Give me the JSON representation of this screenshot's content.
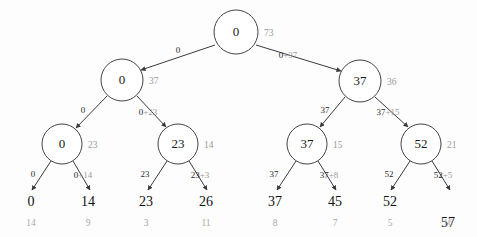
{
  "diagram": {
    "type": "binary-search-tree",
    "title": "",
    "nodes": [
      {
        "id": "n0",
        "value": "0",
        "size": "73",
        "cx": 236,
        "cy": 32,
        "r": 22,
        "level": 0
      },
      {
        "id": "n1",
        "value": "0",
        "size": "37",
        "cx": 122,
        "cy": 80,
        "r": 21,
        "level": 1
      },
      {
        "id": "n2",
        "value": "37",
        "size": "36",
        "cx": 360,
        "cy": 81,
        "r": 21,
        "level": 1
      },
      {
        "id": "n3",
        "value": "0",
        "size": "23",
        "cx": 62,
        "cy": 144,
        "r": 20,
        "level": 2
      },
      {
        "id": "n4",
        "value": "23",
        "size": "14",
        "cx": 178,
        "cy": 144,
        "r": 20,
        "level": 2
      },
      {
        "id": "n5",
        "value": "37",
        "size": "15",
        "cx": 307,
        "cy": 144,
        "r": 20,
        "level": 2
      },
      {
        "id": "n6",
        "value": "52",
        "size": "21",
        "cx": 421,
        "cy": 144,
        "r": 20,
        "level": 2
      }
    ],
    "edges": [
      {
        "id": "e0",
        "from": "n0",
        "to": "n1",
        "label_left": "0",
        "label_right": "",
        "x1": 215,
        "y1": 45,
        "x2": 141,
        "y2": 70,
        "lx": 178,
        "ly": 51
      },
      {
        "id": "e1",
        "from": "n0",
        "to": "n2",
        "label_left": "0",
        "label_right": "+37",
        "x1": 256,
        "y1": 45,
        "x2": 341,
        "y2": 71,
        "lx": 288,
        "ly": 56
      },
      {
        "id": "e2",
        "from": "n1",
        "to": "n3",
        "label_left": "0",
        "label_right": "",
        "x1": 107,
        "y1": 96,
        "x2": 76,
        "y2": 128,
        "lx": 83,
        "ly": 111
      },
      {
        "id": "e3",
        "from": "n1",
        "to": "n4",
        "label_left": "0",
        "label_right": "+23",
        "x1": 137,
        "y1": 96,
        "x2": 166,
        "y2": 127,
        "lx": 148,
        "ly": 113
      },
      {
        "id": "e4",
        "from": "n2",
        "to": "n5",
        "label_left": "37",
        "label_right": "",
        "x1": 345,
        "y1": 97,
        "x2": 320,
        "y2": 127,
        "lx": 325,
        "ly": 111
      },
      {
        "id": "e5",
        "from": "n2",
        "to": "n6",
        "label_left": "37",
        "label_right": "+15",
        "x1": 375,
        "y1": 97,
        "x2": 408,
        "y2": 127,
        "lx": 388,
        "ly": 113
      },
      {
        "id": "e6",
        "from": "n3",
        "to": "l0",
        "label_left": "0",
        "label_right": "",
        "x1": 51,
        "y1": 161,
        "x2": 32,
        "y2": 190,
        "lx": 33,
        "ly": 175
      },
      {
        "id": "e7",
        "from": "n3",
        "to": "l1",
        "label_left": "0",
        "label_right": "+14",
        "x1": 73,
        "y1": 161,
        "x2": 90,
        "y2": 190,
        "lx": 83,
        "ly": 176
      },
      {
        "id": "e8",
        "from": "n4",
        "to": "l2",
        "label_left": "23",
        "label_right": "",
        "x1": 167,
        "y1": 161,
        "x2": 148,
        "y2": 190,
        "lx": 145,
        "ly": 175
      },
      {
        "id": "e9",
        "from": "n4",
        "to": "l3",
        "label_left": "23",
        "label_right": "+3",
        "x1": 189,
        "y1": 161,
        "x2": 207,
        "y2": 190,
        "lx": 200,
        "ly": 176
      },
      {
        "id": "e10",
        "from": "n5",
        "to": "l4",
        "label_left": "37",
        "label_right": "",
        "x1": 296,
        "y1": 161,
        "x2": 277,
        "y2": 190,
        "lx": 274,
        "ly": 175
      },
      {
        "id": "e11",
        "from": "n5",
        "to": "l5",
        "label_left": "37",
        "label_right": "+8",
        "x1": 318,
        "y1": 161,
        "x2": 336,
        "y2": 190,
        "lx": 329,
        "ly": 176
      },
      {
        "id": "e12",
        "from": "n6",
        "to": "l6",
        "label_left": "52",
        "label_right": "",
        "x1": 410,
        "y1": 161,
        "x2": 391,
        "y2": 190,
        "lx": 389,
        "ly": 175
      },
      {
        "id": "e13",
        "from": "n6",
        "to": "l7",
        "label_left": "52",
        "label_right": "+5",
        "x1": 432,
        "y1": 161,
        "x2": 450,
        "y2": 190,
        "lx": 443,
        "ly": 176
      }
    ],
    "leaves": [
      {
        "id": "l0",
        "value": "0",
        "size": "14",
        "x": 31,
        "y": 203,
        "sy": 224
      },
      {
        "id": "l1",
        "value": "14",
        "size": "9",
        "x": 88,
        "y": 203,
        "sy": 224
      },
      {
        "id": "l2",
        "value": "23",
        "size": "3",
        "x": 146,
        "y": 203,
        "sy": 224
      },
      {
        "id": "l3",
        "value": "26",
        "size": "11",
        "x": 206,
        "y": 203,
        "sy": 224
      },
      {
        "id": "l4",
        "value": "37",
        "size": "8",
        "x": 275,
        "y": 203,
        "sy": 224
      },
      {
        "id": "l5",
        "value": "45",
        "size": "7",
        "x": 335,
        "y": 203,
        "sy": 224
      },
      {
        "id": "l6",
        "value": "52",
        "size": "5",
        "x": 390,
        "y": 203,
        "sy": 224
      },
      {
        "id": "l7",
        "value": "57",
        "size": "16",
        "x": 448,
        "y": 224,
        "sy": 224
      }
    ],
    "colors": {
      "node_stroke": "#444444",
      "node_fill": "#ffffff",
      "edge": "#3a3a3a",
      "value_text": "#1a1a1a",
      "size_text": "#9a9a9a",
      "accent_text": "#9a9a9a",
      "background": "#fdfdfd"
    }
  }
}
